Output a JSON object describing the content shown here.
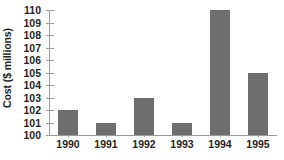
{
  "figure": {
    "cropped_title_remnant": "",
    "bar_color": "#6e6e6e",
    "axis_color": "#9a9a9a",
    "text_color": "#1f1f1f",
    "background": "#ffffff"
  },
  "chart_data": {
    "type": "bar",
    "title": "",
    "xlabel": "",
    "ylabel": "Cost ($ millions)",
    "categories": [
      "1990",
      "1991",
      "1992",
      "1993",
      "1994",
      "1995"
    ],
    "values": [
      102,
      101,
      103,
      101,
      110,
      105
    ],
    "ylim": [
      100,
      110
    ],
    "ytick_labels": [
      "110",
      "109",
      "108",
      "107",
      "106",
      "105",
      "104",
      "103",
      "102",
      "101",
      "100"
    ],
    "ytick_values": [
      110,
      109,
      108,
      107,
      106,
      105,
      104,
      103,
      102,
      101,
      100
    ],
    "grid": false,
    "legend": false,
    "legend_position": "none"
  }
}
